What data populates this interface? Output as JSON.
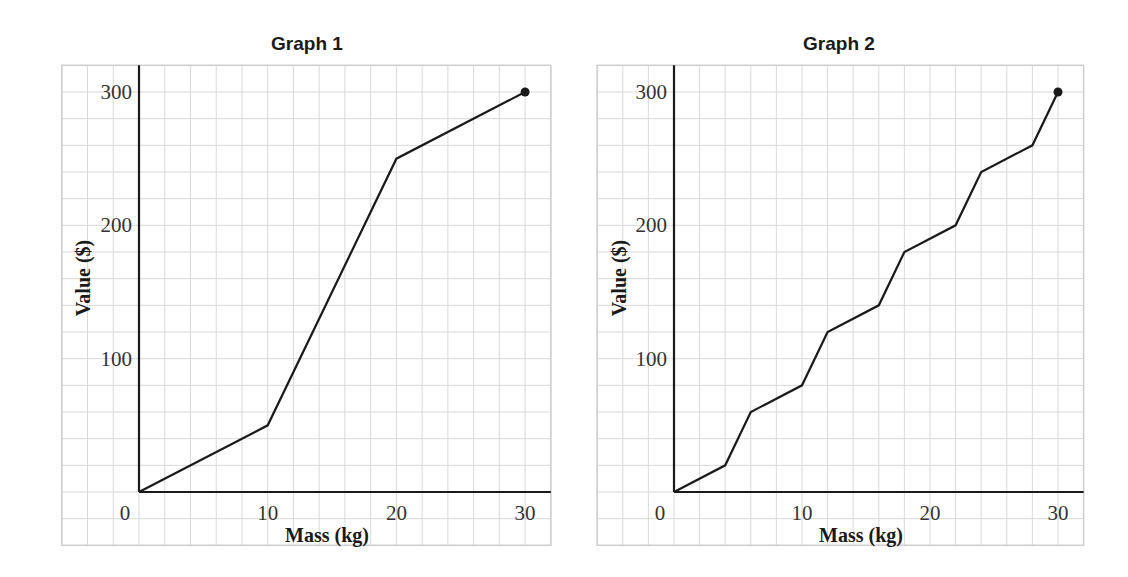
{
  "colors": {
    "grid": "#d9d9d9",
    "frame": "#cfcfcf",
    "axis": "#1a1a1a",
    "line": "#1a1a1a",
    "background": "#ffffff"
  },
  "chart_data": [
    {
      "type": "line",
      "title": "Graph 1",
      "xlabel": "Mass (kg)",
      "ylabel": "Value ($)",
      "x": [
        0,
        10,
        20,
        30
      ],
      "series": [
        {
          "name": "Graph 1",
          "values": [
            0,
            50,
            250,
            300
          ]
        }
      ],
      "endpoint_marker": {
        "x": 30,
        "y": 300
      },
      "x_ticks": [
        0,
        10,
        20,
        30
      ],
      "y_ticks": [
        100,
        200,
        300
      ],
      "xlim": [
        -6,
        32
      ],
      "ylim": [
        -40,
        320
      ],
      "grid": true,
      "grid_step": {
        "x": 2,
        "y": 20
      },
      "legend": "none"
    },
    {
      "type": "line",
      "title": "Graph 2",
      "xlabel": "Mass (kg)",
      "ylabel": "Value ($)",
      "x": [
        0,
        4,
        6,
        10,
        12,
        16,
        18,
        22,
        24,
        28,
        30
      ],
      "series": [
        {
          "name": "Graph 2",
          "values": [
            0,
            20,
            60,
            80,
            120,
            140,
            180,
            200,
            240,
            260,
            300
          ]
        }
      ],
      "endpoint_marker": {
        "x": 30,
        "y": 300
      },
      "x_ticks": [
        0,
        10,
        20,
        30
      ],
      "y_ticks": [
        100,
        200,
        300
      ],
      "xlim": [
        -6,
        32
      ],
      "ylim": [
        -40,
        320
      ],
      "grid": true,
      "grid_step": {
        "x": 2,
        "y": 20
      },
      "legend": "none"
    }
  ],
  "layout": [
    {
      "x0": 139,
      "y0": 492,
      "sx": 12.87,
      "sy": 1.3333,
      "titleX": 307,
      "titleY": 50,
      "ylabelX": 90,
      "ylabelY": 278
    },
    {
      "x0": 674,
      "y0": 492,
      "sx": 12.8,
      "sy": 1.3333,
      "titleX": 839,
      "titleY": 50,
      "ylabelX": 626,
      "ylabelY": 278
    }
  ]
}
